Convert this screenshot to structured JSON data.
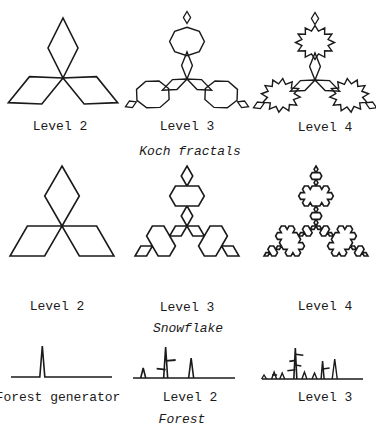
{
  "colors": {
    "stroke": "#1a1a1a",
    "background": "#ffffff"
  },
  "sections": [
    {
      "caption": "Koch fractals",
      "caption_pos": [
        190,
        144
      ],
      "items": [
        {
          "label": "Level 2",
          "label_pos": [
            60,
            119
          ]
        },
        {
          "label": "Level 3",
          "label_pos": [
            187,
            119
          ]
        },
        {
          "label": "Level 4",
          "label_pos": [
            325,
            120
          ]
        }
      ]
    },
    {
      "caption": "Snowflake",
      "caption_pos": [
        188,
        321
      ],
      "items": [
        {
          "label": "Level 2",
          "label_pos": [
            57,
            299
          ]
        },
        {
          "label": "Level 3",
          "label_pos": [
            187,
            300
          ]
        },
        {
          "label": "Level 4",
          "label_pos": [
            325,
            299
          ]
        }
      ]
    },
    {
      "caption": "Forest",
      "caption_pos": [
        182,
        412
      ],
      "items": [
        {
          "label": "Forest generator",
          "label_pos": [
            58,
            390
          ]
        },
        {
          "label": "Level 2",
          "label_pos": [
            190,
            390
          ]
        },
        {
          "label": "Level 3",
          "label_pos": [
            325,
            390
          ]
        }
      ]
    }
  ],
  "figures": {
    "koch_variant": [
      {
        "level": 2,
        "center": [
          63,
          78
        ],
        "arm": 30
      },
      {
        "level": 3,
        "center": [
          187,
          79
        ],
        "arm": 30
      },
      {
        "level": 4,
        "center": [
          315,
          80
        ],
        "arm": 30
      }
    ],
    "snowflake": [
      {
        "level": 2,
        "center": [
          62,
          226
        ],
        "radius": 60
      },
      {
        "level": 3,
        "center": [
          187,
          226
        ],
        "radius": 60
      },
      {
        "level": 4,
        "center": [
          316,
          226
        ],
        "radius": 60
      }
    ],
    "forest": [
      {
        "level": 1,
        "x0": 11,
        "x1": 112,
        "y": 377,
        "height": 31
      },
      {
        "level": 2,
        "x0": 133,
        "x1": 235,
        "y": 378,
        "height": 31
      },
      {
        "level": 3,
        "x0": 262,
        "x1": 363,
        "y": 379,
        "height": 31
      }
    ]
  }
}
